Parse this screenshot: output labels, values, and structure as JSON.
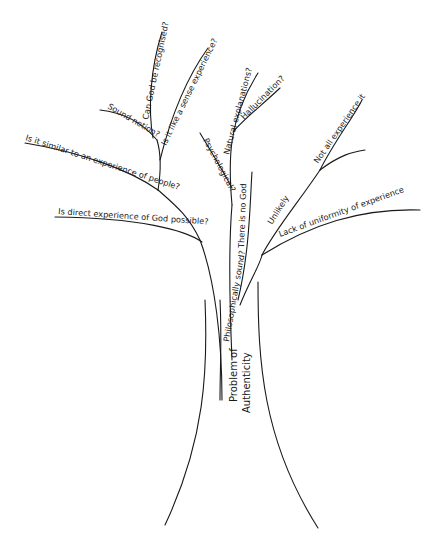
{
  "diagram": {
    "type": "tree",
    "root": {
      "label_line1": "Problem of",
      "label_line2": "Authenticity"
    },
    "branches": {
      "left_main": {
        "label": "Philosophically sound?",
        "children": {
          "direct": "Is direct experience of God possible?",
          "similar": "Is it similar to an experience of people?",
          "sound_notion": "Sound notion?",
          "recognised": "Can God be recognised?",
          "sense": "Is it like a sense experience?"
        }
      },
      "middle_main": {
        "label": "There is no God",
        "children": {
          "psychological": "Psychological?",
          "natural": "Natural explanations?",
          "hallucination": "Hallucination?"
        }
      },
      "right_main": {
        "label": "Unlikely",
        "children": {
          "not_all": "Not all experience it",
          "uniformity": "Lack of uniformity of experience"
        }
      }
    }
  }
}
